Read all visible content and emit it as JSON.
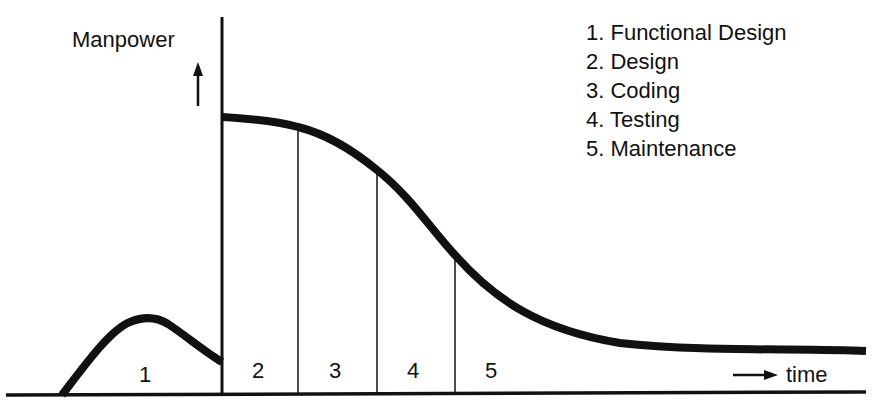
{
  "diagram": {
    "y_axis_label": "Manpower",
    "x_axis_label": "time",
    "colors": {
      "ink": "#111111",
      "background": "#ffffff"
    },
    "legend": [
      {
        "num": "1",
        "text": "1. Functional Design"
      },
      {
        "num": "2",
        "text": "2. Design"
      },
      {
        "num": "3",
        "text": "3. Coding"
      },
      {
        "num": "4",
        "text": "4. Testing"
      },
      {
        "num": "5",
        "text": "5. Maintenance"
      }
    ],
    "phases": [
      {
        "label": "1",
        "name": "Functional Design"
      },
      {
        "label": "2",
        "name": "Design"
      },
      {
        "label": "3",
        "name": "Coding"
      },
      {
        "label": "4",
        "name": "Testing"
      },
      {
        "label": "5",
        "name": "Maintenance"
      }
    ]
  }
}
